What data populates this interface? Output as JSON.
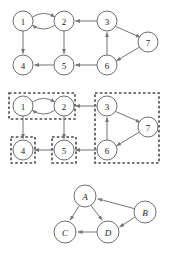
{
  "figure": {
    "background_color": "#ffffff",
    "node_fill": "#ffffff",
    "node_stroke": "#6f6f6f",
    "edge_color": "#757575",
    "box_color": "#4a4a4a",
    "width": 171,
    "height": 260
  },
  "panels": [
    {
      "id": "panel-top",
      "name": "directed-graph",
      "caption": "",
      "nodes": [
        {
          "id": "1",
          "label": "1",
          "cx": 23,
          "cy": 21,
          "r": 10
        },
        {
          "id": "2",
          "label": "2",
          "cx": 64,
          "cy": 21,
          "r": 10
        },
        {
          "id": "3",
          "label": "3",
          "cx": 107,
          "cy": 21,
          "r": 10
        },
        {
          "id": "4",
          "label": "4",
          "cx": 23,
          "cy": 65,
          "r": 10
        },
        {
          "id": "5",
          "label": "5",
          "cx": 64,
          "cy": 65,
          "r": 10
        },
        {
          "id": "6",
          "label": "6",
          "cx": 107,
          "cy": 65,
          "r": 10
        },
        {
          "id": "7",
          "label": "7",
          "cx": 148,
          "cy": 42,
          "r": 10
        }
      ],
      "edges": [
        {
          "from": "1",
          "to": "2",
          "style": "curve-up"
        },
        {
          "from": "2",
          "to": "1",
          "style": "curve-down"
        },
        {
          "from": "3",
          "to": "2",
          "style": "straight"
        },
        {
          "from": "1",
          "to": "4",
          "style": "straight"
        },
        {
          "from": "2",
          "to": "5",
          "style": "straight"
        },
        {
          "from": "5",
          "to": "4",
          "style": "straight"
        },
        {
          "from": "6",
          "to": "5",
          "style": "straight"
        },
        {
          "from": "6",
          "to": "3",
          "style": "straight"
        },
        {
          "from": "3",
          "to": "7",
          "style": "straight"
        },
        {
          "from": "7",
          "to": "6",
          "style": "straight"
        }
      ]
    },
    {
      "id": "panel-middle",
      "name": "graph-with-scc-boxes",
      "caption": "",
      "nodes": [
        {
          "id": "1",
          "label": "1",
          "cx": 23,
          "cy": 21,
          "r": 10
        },
        {
          "id": "2",
          "label": "2",
          "cx": 64,
          "cy": 21,
          "r": 10
        },
        {
          "id": "3",
          "label": "3",
          "cx": 107,
          "cy": 21,
          "r": 10
        },
        {
          "id": "4",
          "label": "4",
          "cx": 23,
          "cy": 65,
          "r": 10
        },
        {
          "id": "5",
          "label": "5",
          "cx": 64,
          "cy": 65,
          "r": 10
        },
        {
          "id": "6",
          "label": "6",
          "cx": 107,
          "cy": 65,
          "r": 10
        },
        {
          "id": "7",
          "label": "7",
          "cx": 148,
          "cy": 42,
          "r": 10
        }
      ],
      "edges": [
        {
          "from": "1",
          "to": "2",
          "style": "curve-up"
        },
        {
          "from": "2",
          "to": "1",
          "style": "curve-down"
        },
        {
          "from": "3",
          "to": "2",
          "style": "straight"
        },
        {
          "from": "1",
          "to": "4",
          "style": "straight"
        },
        {
          "from": "2",
          "to": "5",
          "style": "straight"
        },
        {
          "from": "5",
          "to": "4",
          "style": "straight"
        },
        {
          "from": "6",
          "to": "5",
          "style": "straight"
        },
        {
          "from": "6",
          "to": "3",
          "style": "straight"
        },
        {
          "from": "3",
          "to": "7",
          "style": "straight"
        },
        {
          "from": "7",
          "to": "6",
          "style": "straight"
        }
      ],
      "scc_boxes": [
        {
          "id": "scc-a",
          "members": [
            "1",
            "2"
          ],
          "x": 9,
          "y": 8,
          "width": 66,
          "height": 26
        },
        {
          "id": "scc-c",
          "members": [
            "4"
          ],
          "x": 11,
          "y": 52,
          "width": 24,
          "height": 26
        },
        {
          "id": "scc-d",
          "members": [
            "5"
          ],
          "x": 52,
          "y": 52,
          "width": 24,
          "height": 26
        },
        {
          "id": "scc-b",
          "members": [
            "3",
            "6",
            "7"
          ],
          "x": 95,
          "y": 8,
          "width": 64,
          "height": 70
        }
      ]
    },
    {
      "id": "panel-bottom",
      "name": "condensation-graph",
      "caption": "",
      "nodes": [
        {
          "id": "A",
          "label": "A",
          "cx": 85,
          "cy": 26,
          "r": 11
        },
        {
          "id": "B",
          "label": "B",
          "cx": 145,
          "cy": 42,
          "r": 11
        },
        {
          "id": "C",
          "label": "C",
          "cx": 65,
          "cy": 62,
          "r": 11
        },
        {
          "id": "D",
          "label": "D",
          "cx": 108,
          "cy": 62,
          "r": 11
        }
      ],
      "edges": [
        {
          "from": "A",
          "to": "C",
          "style": "straight"
        },
        {
          "from": "A",
          "to": "D",
          "style": "straight"
        },
        {
          "from": "B",
          "to": "A",
          "style": "straight"
        },
        {
          "from": "B",
          "to": "D",
          "style": "straight"
        },
        {
          "from": "D",
          "to": "C",
          "style": "straight"
        }
      ]
    }
  ]
}
